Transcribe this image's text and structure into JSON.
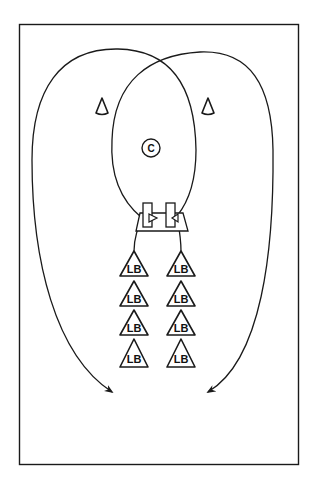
{
  "diagram": {
    "type": "football drill diagram",
    "field_border": {
      "x": 19,
      "y": 24,
      "w": 280,
      "h": 441
    },
    "colors": {
      "line": "#1a1a1a",
      "background": "#ffffff"
    },
    "coach": {
      "label": "C",
      "x": 151,
      "y": 148
    },
    "cones": [
      {
        "name": "left-cone",
        "x": 102,
        "y": 107
      },
      {
        "name": "right-cone",
        "x": 208,
        "y": 107
      }
    ],
    "bags": [
      {
        "name": "left-bag",
        "x": 143,
        "y": 203
      },
      {
        "name": "right-bag",
        "x": 166,
        "y": 203
      }
    ],
    "players": {
      "label": "LB",
      "left_column": [
        {
          "label": "LB",
          "x": 134,
          "y": 268
        },
        {
          "label": "LB",
          "x": 134,
          "y": 298
        },
        {
          "label": "LB",
          "x": 134,
          "y": 327
        },
        {
          "label": "LB",
          "x": 134,
          "y": 356
        }
      ],
      "right_column": [
        {
          "label": "LB",
          "x": 181,
          "y": 268
        },
        {
          "label": "LB",
          "x": 181,
          "y": 298
        },
        {
          "label": "LB",
          "x": 181,
          "y": 327
        },
        {
          "label": "LB",
          "x": 181,
          "y": 356
        }
      ]
    },
    "routes": [
      {
        "name": "left-lb-route",
        "from": "left column",
        "ends": "arrow bottom right"
      },
      {
        "name": "right-lb-route",
        "from": "right column",
        "ends": "arrow bottom left"
      }
    ]
  }
}
